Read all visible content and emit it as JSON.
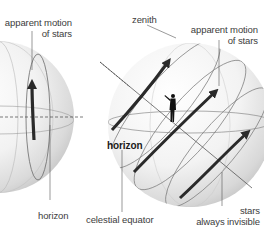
{
  "diagram": {
    "left_sphere": {
      "labels": {
        "motion_line1": "apparent motion",
        "motion_line2": "of stars",
        "horizon": "horizon"
      }
    },
    "right_sphere": {
      "labels": {
        "zenith": "zenith",
        "motion_line1": "apparent motion",
        "motion_line2": "of stars",
        "horizon": "horizon",
        "celestial_equator": "celestial equator",
        "invisible_line1": "stars",
        "invisible_line2": "always invisible"
      }
    },
    "colors": {
      "sphere_light": "#ffffff",
      "sphere_shade": "#cfcfcf",
      "arrow": "#2a2a2a",
      "line": "#555555",
      "text": "#3c3c3c"
    }
  }
}
